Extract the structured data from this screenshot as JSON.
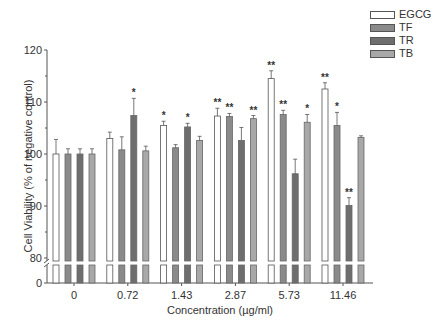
{
  "chart_data": {
    "type": "bar",
    "title": "",
    "xlabel": "Concentration (µg/ml)",
    "ylabel": "Cell Viability (% of negative control)",
    "ylim": [
      80,
      120
    ],
    "yticks": [
      0,
      80,
      90,
      100,
      110,
      120
    ],
    "axis_break": "between 0 and 80",
    "categories": [
      "0",
      "0.72",
      "1.43",
      "2.87",
      "5.73",
      "11.46"
    ],
    "legend_position": "top-right",
    "series": [
      {
        "name": "EGCG",
        "color": "#ffffff",
        "values": [
          100.0,
          103.0,
          105.5,
          107.3,
          114.5,
          112.5
        ],
        "errors": [
          2.8,
          1.2,
          0.8,
          1.5,
          1.5,
          1.2
        ],
        "significance": [
          "",
          "",
          "*",
          "**",
          "**",
          "**"
        ]
      },
      {
        "name": "TF",
        "color": "#8a8a8a",
        "values": [
          100.0,
          100.8,
          101.2,
          107.2,
          107.6,
          105.5
        ],
        "errors": [
          1.0,
          2.5,
          0.6,
          0.6,
          0.8,
          2.5
        ],
        "significance": [
          "",
          "",
          "",
          "**",
          "**",
          "*"
        ]
      },
      {
        "name": "TR",
        "color": "#6e6e6e",
        "values": [
          100.0,
          107.4,
          105.2,
          102.6,
          96.2,
          90.1
        ],
        "errors": [
          1.0,
          3.3,
          0.7,
          2.5,
          2.8,
          1.5
        ],
        "significance": [
          "",
          "*",
          "*",
          "",
          "",
          "**"
        ]
      },
      {
        "name": "TB",
        "color": "#a8a8a8",
        "values": [
          100.0,
          100.6,
          102.6,
          106.8,
          106.1,
          103.2
        ],
        "errors": [
          1.0,
          0.9,
          0.8,
          0.6,
          1.5,
          0.3
        ],
        "significance": [
          "",
          "",
          "",
          "**",
          "*",
          ""
        ]
      }
    ]
  }
}
